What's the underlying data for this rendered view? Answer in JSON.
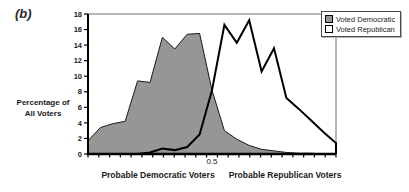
{
  "figure_label": "(b)",
  "y_axis_title_line1": "Percentage of",
  "y_axis_title_line2": "All Voters",
  "x_axis_title_left": "Probable Democratic Voters",
  "x_axis_title_right": "Probable Republican Voters",
  "x_center_tick_label": "0.5",
  "legend": {
    "position": "top-right",
    "items": [
      {
        "label": "Voted Democratic"
      },
      {
        "label": "Voted Republican"
      }
    ]
  },
  "colors": {
    "democratic_fill": "#969696",
    "democratic_stroke": "#1a1a1a",
    "republican_fill": "#ffffff",
    "republican_stroke": "#000000",
    "axis": "#000000",
    "frame": "#6e6e6e",
    "text": "#1a1a1a",
    "background": "#ffffff"
  },
  "chart_data": {
    "type": "area",
    "title": "",
    "xlabel_left": "Probable Democratic Voters",
    "xlabel_right": "Probable Republican Voters",
    "ylabel": "Percentage of All Voters",
    "ylim": [
      0,
      18
    ],
    "y_ticks": [
      0,
      2,
      4,
      6,
      8,
      10,
      12,
      14,
      16,
      18
    ],
    "x_tick_count": 24,
    "x_center_label": "0.5",
    "grid": false,
    "legend_position": "top-right",
    "x": [
      0,
      0.05,
      0.1,
      0.15,
      0.2,
      0.25,
      0.3,
      0.35,
      0.4,
      0.45,
      0.5,
      0.55,
      0.6,
      0.65,
      0.7,
      0.75,
      0.8,
      0.85,
      0.9,
      0.95,
      1.0
    ],
    "series": [
      {
        "name": "Voted Democratic",
        "values": [
          1.7,
          3.4,
          3.9,
          4.2,
          9.4,
          9.2,
          15.0,
          13.5,
          15.4,
          15.5,
          8.2,
          3.0,
          1.9,
          1.1,
          0.6,
          0.4,
          0.2,
          0.1,
          0.1,
          0.0,
          0.0
        ]
      },
      {
        "name": "Voted Republican",
        "values": [
          0,
          0,
          0,
          0,
          0,
          0.2,
          0.7,
          0.5,
          0.9,
          2.5,
          8.2,
          16.6,
          14.3,
          17.2,
          10.6,
          13.6,
          7.2,
          5.8,
          4.3,
          2.8,
          1.4
        ]
      }
    ]
  }
}
